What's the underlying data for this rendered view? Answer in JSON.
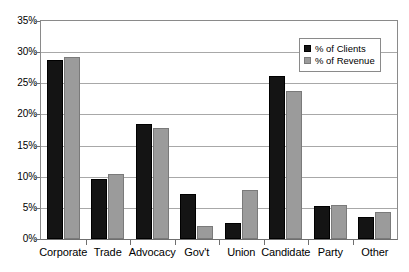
{
  "chart_data": {
    "type": "bar",
    "title": "",
    "subtitle": "",
    "xlabel": "",
    "ylabel": "",
    "ylim": [
      0,
      35
    ],
    "ytick_step": 5,
    "ytick_labels": [
      "0%",
      "5%",
      "10%",
      "15%",
      "20%",
      "25%",
      "30%",
      "35%"
    ],
    "ytick_values": [
      0,
      5,
      10,
      15,
      20,
      25,
      30,
      35
    ],
    "grid": true,
    "grid_axis": "y",
    "legend_position": "top-right-inside",
    "categories": [
      "Corporate",
      "Trade",
      "Advocacy",
      "Gov't",
      "Union",
      "Candidate",
      "Party",
      "Other"
    ],
    "series": [
      {
        "name": "% of Clients",
        "color": "#141414",
        "values": [
          28.8,
          9.6,
          18.5,
          7.2,
          2.6,
          26.1,
          5.3,
          3.6
        ]
      },
      {
        "name": "% of Revenue",
        "color": "#9b9b9b",
        "values": [
          29.2,
          10.5,
          17.8,
          2.1,
          7.9,
          23.8,
          5.5,
          4.3
        ]
      }
    ]
  },
  "legend": {
    "items": [
      {
        "label": "% of Clients",
        "swatch": "clients"
      },
      {
        "label": "% of Revenue",
        "swatch": "revenue"
      }
    ]
  },
  "colors": {
    "series_clients": "#141414",
    "series_revenue": "#9b9b9b",
    "gridline": "#a8a8a8",
    "axis": "#6f6f6f",
    "background": "#ffffff"
  }
}
